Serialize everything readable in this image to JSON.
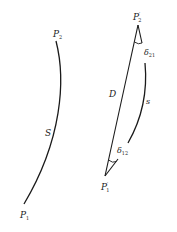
{
  "diagram": {
    "left_figure": {
      "curve_label": "S",
      "start_point": {
        "name": "P",
        "sub": "1"
      },
      "end_point": {
        "name": "P",
        "sub": "2"
      }
    },
    "right_figure": {
      "chord_label": "D",
      "arc_label": "s",
      "start_point": {
        "name": "P",
        "sup": "′",
        "sub": "1"
      },
      "end_point": {
        "name": "P",
        "sup": "′",
        "sub": "2"
      },
      "angle_at_end": {
        "name": "δ",
        "sub": "21"
      },
      "angle_at_start": {
        "name": "δ",
        "sub": "12"
      }
    },
    "colors": {
      "stroke": "#1a1a1a",
      "background": "#ffffff"
    }
  }
}
